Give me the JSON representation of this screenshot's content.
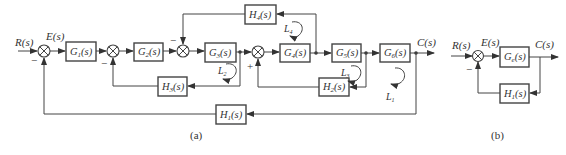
{
  "diagram_a": {
    "caption": "(a)",
    "input_label": "R(s)",
    "error_label": "E(s)",
    "output_label": "C(s)",
    "forward_blocks": [
      {
        "name": "G",
        "sub": "1",
        "tail": "(s)"
      },
      {
        "name": "G",
        "sub": "2",
        "tail": "(s)"
      },
      {
        "name": "G",
        "sub": "3",
        "tail": "(s)"
      },
      {
        "name": "G",
        "sub": "4",
        "tail": "(s)"
      },
      {
        "name": "G",
        "sub": "5",
        "tail": "(s)"
      },
      {
        "name": "G",
        "sub": "6",
        "tail": "(s)"
      }
    ],
    "feedback_blocks": [
      {
        "name": "H",
        "sub": "1",
        "tail": "(s)"
      },
      {
        "name": "H",
        "sub": "2",
        "tail": "(s)"
      },
      {
        "name": "H",
        "sub": "3",
        "tail": "(s)"
      },
      {
        "name": "H",
        "sub": "4",
        "tail": "(s)"
      }
    ],
    "loops": [
      {
        "name": "L",
        "sub": "1"
      },
      {
        "name": "L",
        "sub": "2"
      },
      {
        "name": "L",
        "sub": "3"
      },
      {
        "name": "L",
        "sub": "4"
      }
    ],
    "signs": {
      "sum1": "−",
      "sum2": "−",
      "sum3": "−",
      "sum4": "+"
    }
  },
  "diagram_b": {
    "caption": "(b)",
    "input_label": "R(s)",
    "error_label": "E(s)",
    "output_label": "C(s)",
    "forward_block": {
      "name": "G",
      "sub": "e",
      "tail": "(s)"
    },
    "feedback_block": {
      "name": "H",
      "sub": "1",
      "tail": "(s)"
    },
    "sign": "−"
  }
}
